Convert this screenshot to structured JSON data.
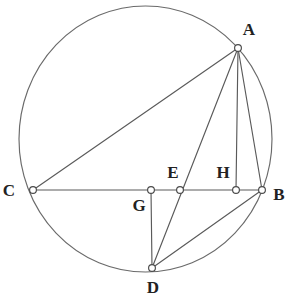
{
  "figure": {
    "canvas": {
      "width": 292,
      "height": 308
    },
    "style": {
      "background_color": "#ffffff",
      "stroke_color": "#5a5a5a",
      "circle_stroke_color": "#6a6a6a",
      "marker_fill_color": "#ffffff",
      "marker_stroke_color": "#4a4a4a",
      "label_color": "#222222",
      "stroke_width": 1.15,
      "marker_radius": 3.4
    }
  },
  "circle": {
    "name": "main-circle",
    "cx": 145.5,
    "cy": 139,
    "rx": 126.5,
    "ry": 133
  },
  "points": [
    {
      "id": "A",
      "label": "A",
      "x": 238,
      "y": 48,
      "label_x": 249,
      "label_y": 31,
      "on_circle": true
    },
    {
      "id": "B",
      "label": "B",
      "x": 262,
      "y": 190,
      "label_x": 279,
      "label_y": 196,
      "on_circle": true
    },
    {
      "id": "C",
      "label": "C",
      "x": 33,
      "y": 190,
      "label_x": 9,
      "label_y": 192,
      "on_circle": true
    },
    {
      "id": "D",
      "label": "D",
      "x": 152,
      "y": 268,
      "label_x": 153,
      "label_y": 289,
      "on_circle": true
    },
    {
      "id": "E",
      "label": "E",
      "x": 180,
      "y": 190,
      "label_x": 173,
      "label_y": 174,
      "on_circle": false
    },
    {
      "id": "G",
      "label": "G",
      "x": 151,
      "y": 190,
      "label_x": 139,
      "label_y": 207,
      "on_circle": false
    },
    {
      "id": "H",
      "label": "H",
      "x": 236,
      "y": 190,
      "label_x": 223,
      "label_y": 174,
      "on_circle": false
    }
  ],
  "segments": [
    {
      "name": "segment-CB",
      "from": "C",
      "to": "B",
      "x1": 33,
      "y1": 190,
      "x2": 262,
      "y2": 190
    },
    {
      "name": "segment-CA",
      "from": "C",
      "to": "A",
      "x1": 33,
      "y1": 190,
      "x2": 238,
      "y2": 48
    },
    {
      "name": "segment-AD",
      "from": "A",
      "to": "D",
      "x1": 238,
      "y1": 48,
      "x2": 152,
      "y2": 268
    },
    {
      "name": "segment-AH",
      "from": "A",
      "to": "H",
      "x1": 238,
      "y1": 48,
      "x2": 236,
      "y2": 190
    },
    {
      "name": "segment-AB",
      "from": "A",
      "to": "B",
      "x1": 238,
      "y1": 48,
      "x2": 262,
      "y2": 190
    },
    {
      "name": "segment-GD",
      "from": "G",
      "to": "D",
      "x1": 151,
      "y1": 190,
      "x2": 152,
      "y2": 268
    },
    {
      "name": "segment-DB",
      "from": "D",
      "to": "B",
      "x1": 152,
      "y1": 268,
      "x2": 262,
      "y2": 190
    }
  ]
}
